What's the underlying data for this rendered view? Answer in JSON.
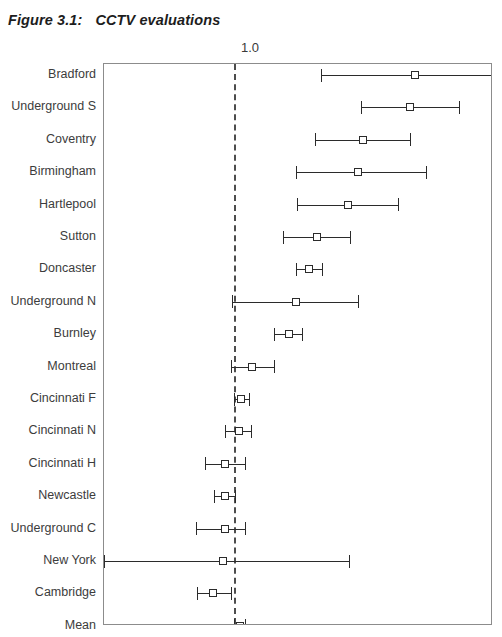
{
  "figure": {
    "number": "Figure 3.1:",
    "title": "CCTV evaluations"
  },
  "axis": {
    "tick_label": "1.0",
    "reference_value": 1.0,
    "x_min": 0.0,
    "x_max": 3.0
  },
  "colors": {
    "title": "#1d1d1d",
    "label": "#3c3c3c",
    "frame": "#8c8c8c",
    "line": "#2b2b2b",
    "reference": "#4d4d4d",
    "marker_fill": "#ffffff"
  },
  "chart_data": {
    "type": "scatter",
    "title": "CCTV evaluations",
    "subtitle": "",
    "xlabel": "",
    "ylabel": "",
    "grid": false,
    "legend": "none",
    "xlim": [
      0.0,
      3.0
    ],
    "ylim": [
      0,
      18
    ],
    "xticks": [
      "1.0"
    ],
    "xtick_values": [
      1.0
    ],
    "reference_line": 1.0,
    "orientation": "horizontal",
    "categories": [
      "Bradford",
      "Underground S",
      "Coventry",
      "Birmingham",
      "Hartlepool",
      "Sutton",
      "Doncaster",
      "Underground N",
      "Burnley",
      "Montreal",
      "Cincinnati F",
      "Cincinnati N",
      "Cincinnati H",
      "Newcastle",
      "Underground C",
      "New York",
      "Cambridge",
      "Mean"
    ],
    "series": [
      {
        "name": "Effect estimate with 95% confidence interval",
        "points": [
          {
            "label": "Bradford",
            "estimate": 2.4,
            "ci_low": 1.67,
            "ci_high": 3.05,
            "ci_high_clipped": true
          },
          {
            "label": "Underground S",
            "estimate": 2.36,
            "ci_low": 1.98,
            "ci_high": 2.74,
            "ci_high_clipped": false
          },
          {
            "label": "Coventry",
            "estimate": 2.0,
            "ci_low": 1.63,
            "ci_high": 2.36,
            "ci_high_clipped": false
          },
          {
            "label": "Birmingham",
            "estimate": 1.96,
            "ci_low": 1.48,
            "ci_high": 2.48,
            "ci_high_clipped": false
          },
          {
            "label": "Hartlepool",
            "estimate": 1.88,
            "ci_low": 1.49,
            "ci_high": 2.27,
            "ci_high_clipped": false
          },
          {
            "label": "Sutton",
            "estimate": 1.64,
            "ci_low": 1.38,
            "ci_high": 1.9,
            "ci_high_clipped": false
          },
          {
            "label": "Doncaster",
            "estimate": 1.58,
            "ci_low": 1.48,
            "ci_high": 1.68,
            "ci_high_clipped": false
          },
          {
            "label": "Underground N",
            "estimate": 1.48,
            "ci_low": 0.99,
            "ci_high": 1.96,
            "ci_high_clipped": false
          },
          {
            "label": "Burnley",
            "estimate": 1.43,
            "ci_low": 1.31,
            "ci_high": 1.53,
            "ci_high_clipped": false
          },
          {
            "label": "Montreal",
            "estimate": 1.14,
            "ci_low": 0.98,
            "ci_high": 1.31,
            "ci_high_clipped": false
          },
          {
            "label": "Cincinnati F",
            "estimate": 1.06,
            "ci_low": 1.0,
            "ci_high": 1.12,
            "ci_high_clipped": false
          },
          {
            "label": "Cincinnati N",
            "estimate": 1.04,
            "ci_low": 0.93,
            "ci_high": 1.13,
            "ci_high_clipped": false
          },
          {
            "label": "Cincinnati H",
            "estimate": 0.93,
            "ci_low": 0.78,
            "ci_high": 1.09,
            "ci_high_clipped": false
          },
          {
            "label": "Newcastle",
            "estimate": 0.93,
            "ci_low": 0.85,
            "ci_high": 1.01,
            "ci_high_clipped": false
          },
          {
            "label": "Underground C",
            "estimate": 0.93,
            "ci_low": 0.71,
            "ci_high": 1.09,
            "ci_high_clipped": false
          },
          {
            "label": "New York",
            "estimate": 0.92,
            "ci_low": 0.0,
            "ci_high": 1.89,
            "ci_high_clipped": false
          },
          {
            "label": "Cambridge",
            "estimate": 0.84,
            "ci_low": 0.72,
            "ci_high": 0.98,
            "ci_high_clipped": false
          },
          {
            "label": "Mean",
            "estimate": 1.05,
            "ci_low": 1.0,
            "ci_high": 1.09,
            "ci_high_clipped": false
          }
        ]
      }
    ]
  },
  "geometry": {
    "plot_left_px": 103,
    "plot_top_px": 63,
    "plot_width_px": 389,
    "plot_height_px": 562,
    "row_first_y_px": 74,
    "row_step_px": 32.4
  }
}
